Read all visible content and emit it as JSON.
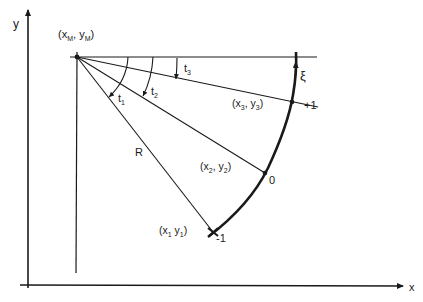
{
  "axes": {
    "x_label": "x",
    "y_label": "y"
  },
  "center": {
    "label_open": "(x",
    "sub_x": "M",
    "comma": ", y",
    "sub_y": "M",
    "label_close": ")"
  },
  "angles": {
    "t1": "t",
    "t1_sub": "1",
    "t2": "t",
    "t2_sub": "2",
    "t3": "t",
    "t3_sub": "3"
  },
  "radius_label": "R",
  "points": [
    {
      "name": "x1",
      "label_x": "(x",
      "sub_x": "1",
      "label_y": "  y",
      "sub_y": "1",
      "close": ")",
      "param": "-1"
    },
    {
      "name": "x2",
      "label_x": "(x",
      "sub_x": "2",
      "label_y": ", y",
      "sub_y": "2",
      "close": ")",
      "param": "0"
    },
    {
      "name": "x3",
      "label_x": "(x",
      "sub_x": "3",
      "label_y": ", y",
      "sub_y": "3",
      "close": ")",
      "param": "+1"
    }
  ],
  "arc_parameter": "ξ",
  "colors": {
    "line": "#1a1a1a",
    "background": "#ffffff"
  }
}
